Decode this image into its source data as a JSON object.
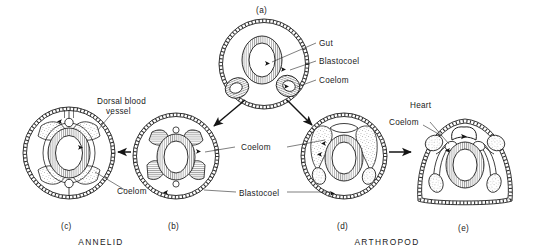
{
  "figure": {
    "title_caption_a": "(a)",
    "caption_b": "(b)",
    "caption_c": "(c)",
    "caption_d": "(d)",
    "caption_e": "(e)",
    "taxon_left": "ANNELID",
    "taxon_right": "ARTHROPOD"
  },
  "labels": {
    "gut": "Gut",
    "blastocoel_a": "Blastocoel",
    "coelom_a": "Coelom",
    "dorsal_blood_vessel_line1": "Dorsal blood",
    "dorsal_blood_vessel_line2": "vessel",
    "coelom_c": "Coelom",
    "coelom_center": "Coelom",
    "blastocoel_center": "Blastocoel",
    "heart": "Heart",
    "coelom_e": "Coelom"
  },
  "colors": {
    "background": "#ffffff",
    "ink": "#1d1d1d",
    "hatch": "#4a4a4a",
    "stipple": "#6e6e6e",
    "leader": "#2a2a2a"
  },
  "panels": [
    {
      "id": "a",
      "caption": "(a)",
      "shape": "circle",
      "cx": 264,
      "cy": 64,
      "r": 45,
      "stage": "early embryo with gut, blastocoel and paired coelomic sacs"
    },
    {
      "id": "b",
      "caption": "(b)",
      "shape": "circle",
      "cx": 176,
      "cy": 156,
      "r": 43,
      "stage": "expanding coelom reducing blastocoel"
    },
    {
      "id": "c",
      "caption": "(c)",
      "shape": "circle",
      "cx": 69,
      "cy": 153,
      "r": 46,
      "stage": "annelid with large coelom and dorsal blood vessel"
    },
    {
      "id": "d",
      "caption": "(d)",
      "shape": "circle",
      "cx": 344,
      "cy": 156,
      "r": 43,
      "stage": "arthropod precursor with restricted coelom"
    },
    {
      "id": "e",
      "caption": "(e)",
      "shape": "dome",
      "cx": 465,
      "cy": 160,
      "r": 50,
      "stage": "arthropod with heart and haemocoel"
    }
  ]
}
